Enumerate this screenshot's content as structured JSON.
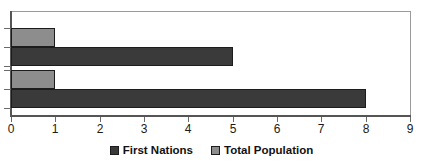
{
  "chart_data": {
    "type": "bar",
    "orientation": "horizontal",
    "title": "",
    "xlabel": "",
    "ylabel": "",
    "xlim": [
      0,
      9
    ],
    "grid": false,
    "legend_position": "bottom",
    "categories": [
      "Group 1",
      "Group 2"
    ],
    "xticks": [
      "0",
      "1",
      "2",
      "3",
      "4",
      "5",
      "6",
      "7",
      "8",
      "9"
    ],
    "series": [
      {
        "name": "First Nations",
        "color": "#3a3a3a",
        "values": [
          5,
          8
        ]
      },
      {
        "name": "Total Population",
        "color": "#8d8d8d",
        "values": [
          1,
          1
        ]
      }
    ]
  },
  "legend": {
    "items": [
      {
        "label": "First Nations",
        "swatch_class": "series-first-nations"
      },
      {
        "label": "Total Population",
        "swatch_class": "series-total-population"
      }
    ]
  },
  "axis": {
    "tick_labels": [
      "0",
      "1",
      "2",
      "3",
      "4",
      "5",
      "6",
      "7",
      "8",
      "9"
    ]
  }
}
